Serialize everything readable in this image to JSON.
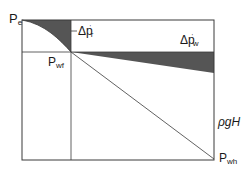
{
  "diagram": {
    "labels": {
      "pe": {
        "main": "P",
        "sub": "e"
      },
      "pwf": {
        "main": "P",
        "sub": "wf"
      },
      "pwh": {
        "main": "P",
        "sub": "wh"
      },
      "delta_pr": {
        "main": "Δp",
        "sub": "r",
        "sup": "'"
      },
      "delta_pw": {
        "main": "Δp",
        "sub": "w",
        "sup": "'"
      },
      "rho_g_h": "ρgH"
    },
    "colors": {
      "line": "#3a3a3a",
      "fill": "#555555",
      "background": "#ffffff"
    }
  }
}
